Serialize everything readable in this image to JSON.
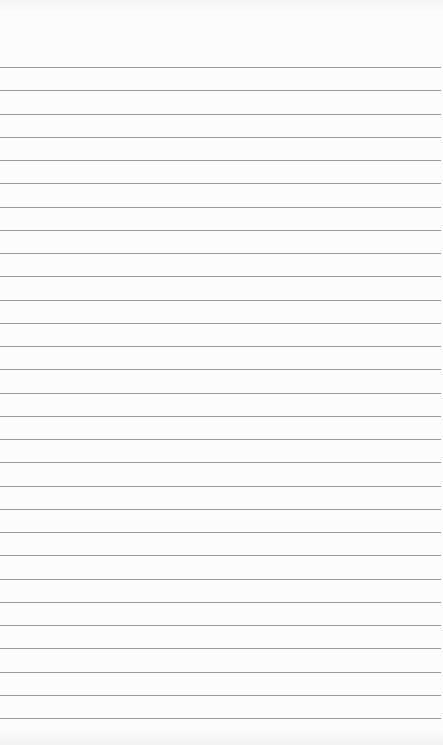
{
  "paper": {
    "type": "lined-paper",
    "background_color": "#fcfcfc",
    "rule_color": "#9a9a9a",
    "rule_count": 29,
    "first_rule_y": 67,
    "rule_spacing": 23.25
  }
}
